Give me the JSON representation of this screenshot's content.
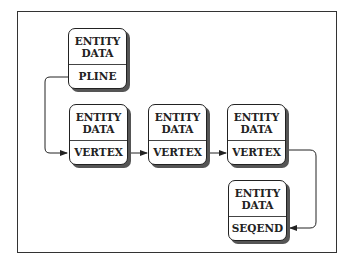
{
  "diagram": {
    "nodes": [
      {
        "id": "pline",
        "top": "ENTITY DATA",
        "top_line1": "ENTITY",
        "top_line2": "DATA",
        "bottom": "PLINE"
      },
      {
        "id": "vertex1",
        "top_line1": "ENTITY",
        "top_line2": "DATA",
        "bottom": "VERTEX"
      },
      {
        "id": "vertex2",
        "top_line1": "ENTITY",
        "top_line2": "DATA",
        "bottom": "VERTEX"
      },
      {
        "id": "vertex3",
        "top_line1": "ENTITY",
        "top_line2": "DATA",
        "bottom": "VERTEX"
      },
      {
        "id": "seqend",
        "top_line1": "ENTITY",
        "top_line2": "DATA",
        "bottom": "SEQEND"
      }
    ],
    "edges": [
      {
        "from": "pline",
        "to": "vertex1"
      },
      {
        "from": "vertex1",
        "to": "vertex2"
      },
      {
        "from": "vertex2",
        "to": "vertex3"
      },
      {
        "from": "vertex3",
        "to": "seqend"
      }
    ],
    "colors": {
      "line": "#222222",
      "shadow": "#555555",
      "background": "#ffffff"
    }
  }
}
